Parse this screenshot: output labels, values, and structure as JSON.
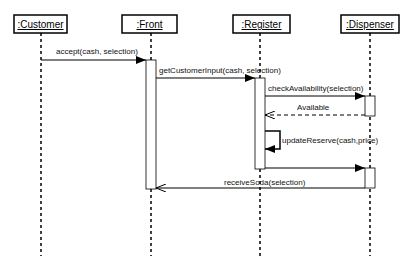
{
  "diagram": {
    "type": "sequence",
    "objects": [
      {
        "id": "customer",
        "label": ":Customer",
        "x": 41,
        "box": [
          14,
          15,
          53,
          18
        ]
      },
      {
        "id": "front",
        "label": ":Front",
        "x": 151,
        "box": [
          122,
          15,
          55,
          18
        ]
      },
      {
        "id": "register",
        "label": ":Register",
        "x": 260,
        "box": [
          233,
          15,
          57,
          18
        ]
      },
      {
        "id": "dispenser",
        "label": ":Dispenser",
        "x": 370,
        "box": [
          341,
          15,
          58,
          18
        ]
      }
    ],
    "messages": [
      {
        "id": "m1",
        "label": "accept(cash, selection)",
        "from": "customer",
        "to": "front",
        "style": "sync"
      },
      {
        "id": "m2",
        "label": "getCustomerInput(cash, selection)",
        "from": "front",
        "to": "register",
        "style": "sync"
      },
      {
        "id": "m3",
        "label": "checkAvailability(selection)",
        "from": "register",
        "to": "dispenser",
        "style": "sync"
      },
      {
        "id": "m4",
        "label": "Available",
        "from": "dispenser",
        "to": "register",
        "style": "return"
      },
      {
        "id": "m5",
        "label": "updateReserve(cash,price)",
        "from": "register",
        "to": "register",
        "style": "self"
      },
      {
        "id": "m6",
        "label": "",
        "from": "register",
        "to": "dispenser",
        "style": "sync"
      },
      {
        "id": "m7",
        "label": "receiveSoda(selection)",
        "from": "dispenser",
        "to": "front",
        "style": "sync-open"
      }
    ]
  }
}
